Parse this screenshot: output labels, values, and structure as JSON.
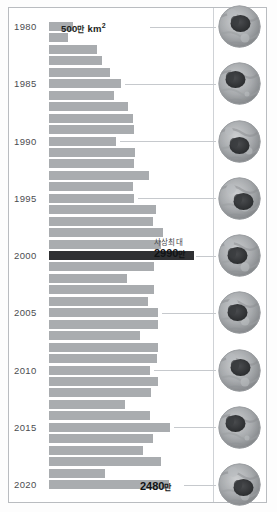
{
  "figure": {
    "legend_label": "500만 km²",
    "legend_value": "500",
    "legend_unit": "만",
    "legend_unit2": "km",
    "legend_sup": "2",
    "peak_note": "사상최대",
    "peak_value": "2990",
    "peak_unit": "만",
    "end_value": "2480",
    "end_unit": "만",
    "bar_color": "#a9acaf",
    "highlight_color": "#2f3033",
    "frame_color": "#b9bcc0",
    "leader_color": "#c6c9cd"
  },
  "chart_data": {
    "type": "bar",
    "orientation": "horizontal",
    "title": "",
    "xlabel": "",
    "ylabel": "",
    "unit": "만 km²",
    "legend": [
      "500만 km²"
    ],
    "grid": false,
    "xlim": [
      0,
      3200
    ],
    "categories": [
      "1980",
      "1981",
      "1982",
      "1983",
      "1984",
      "1985",
      "1986",
      "1987",
      "1988",
      "1989",
      "1990",
      "1991",
      "1992",
      "1993",
      "1994",
      "1995",
      "1996",
      "1997",
      "1998",
      "1999",
      "2000",
      "2001",
      "2002",
      "2003",
      "2004",
      "2005",
      "2006",
      "2007",
      "2008",
      "2009",
      "2010",
      "2011",
      "2012",
      "2013",
      "2014",
      "2015",
      "2016",
      "2017",
      "2018",
      "2019",
      "2020"
    ],
    "values": [
      500,
      400,
      1000,
      1090,
      1250,
      1480,
      1340,
      1640,
      1740,
      1760,
      1390,
      1780,
      1760,
      2060,
      1730,
      1760,
      2200,
      2150,
      2360,
      2320,
      2990,
      2170,
      1610,
      2170,
      2040,
      2250,
      2260,
      1880,
      2250,
      2220,
      2090,
      2260,
      2110,
      1560,
      2090,
      2490,
      2140,
      1940,
      2310,
      1150,
      2480
    ],
    "highlight_index": 20,
    "highlight_label": "사상최대 2990만",
    "end_label": "2480만",
    "axis_ticks": [
      "1980",
      "1985",
      "1990",
      "1995",
      "2000",
      "2005",
      "2010",
      "2015",
      "2020"
    ],
    "annotations": [
      {
        "index": 0,
        "text": "500만 km²"
      },
      {
        "index": 20,
        "text": "사상최대 2990만"
      },
      {
        "index": 40,
        "text": "2480만"
      }
    ]
  },
  "satellites": {
    "name": "arctic-sea-ice-thumbnail",
    "items": [
      {
        "year": "1980"
      },
      {
        "year": "1985"
      },
      {
        "year": "1990"
      },
      {
        "year": "1995"
      },
      {
        "year": "2000"
      },
      {
        "year": "2005"
      },
      {
        "year": "2010"
      },
      {
        "year": "2015"
      },
      {
        "year": "2020"
      }
    ]
  }
}
